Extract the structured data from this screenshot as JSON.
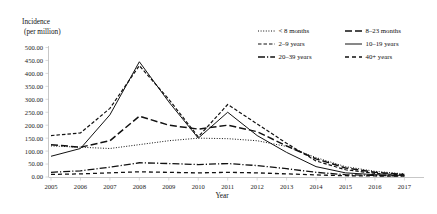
{
  "chart_data": {
    "type": "line",
    "title": "",
    "ylabel": "Incidence\n(per million)",
    "ylabel_line1": "Incidence",
    "ylabel_line2": "(per million)",
    "xlabel": "Year",
    "categories": [
      2005,
      2006,
      2007,
      2008,
      2009,
      2010,
      2011,
      2012,
      2013,
      2014,
      2015,
      2016,
      2017
    ],
    "x": [
      "2005",
      "2006",
      "2007",
      "2008",
      "2009",
      "2010",
      "2011",
      "2012",
      "2013",
      "2014",
      "2015",
      "2016",
      "2017"
    ],
    "ylim": [
      0,
      500
    ],
    "ytick_step": 50,
    "ytick_labels": [
      "0.00",
      "50.00",
      "100.00",
      "150.00",
      "200.00",
      "250.00",
      "300.00",
      "350.00",
      "400.00",
      "450.00",
      "500.00"
    ],
    "grid": false,
    "legend_position": "top-right",
    "legend_columns": 2,
    "series": [
      {
        "name": "< 8 months",
        "style": "dotted",
        "dash": "1,1.6",
        "width": 1.0,
        "values": [
          120,
          115,
          110,
          125,
          140,
          150,
          148,
          140,
          118,
          75,
          40,
          22,
          12
        ]
      },
      {
        "name": "8–23 months",
        "style": "long-dash",
        "dash": "7,3",
        "width": 1.5,
        "values": [
          125,
          115,
          140,
          235,
          200,
          185,
          200,
          175,
          120,
          70,
          35,
          18,
          10
        ]
      },
      {
        "name": "2–9 years",
        "style": "short-dash",
        "dash": "3.5,2",
        "width": 1.2,
        "values": [
          160,
          170,
          265,
          430,
          300,
          155,
          280,
          205,
          130,
          62,
          28,
          14,
          8
        ]
      },
      {
        "name": "10–19 years",
        "style": "solid",
        "dash": "none",
        "width": 1.0,
        "values": [
          80,
          110,
          240,
          445,
          290,
          150,
          250,
          160,
          95,
          40,
          16,
          9,
          6
        ]
      },
      {
        "name": "20–39 years",
        "style": "dash-dot",
        "dash": "7,2,1.2,2",
        "width": 1.3,
        "values": [
          18,
          24,
          38,
          55,
          52,
          48,
          52,
          44,
          32,
          18,
          9,
          6,
          4
        ]
      },
      {
        "name": "40+ years",
        "style": "dash",
        "dash": "4,3",
        "width": 1.3,
        "values": [
          10,
          12,
          16,
          20,
          18,
          16,
          18,
          16,
          12,
          8,
          5,
          4,
          3
        ]
      }
    ]
  },
  "legend": {
    "items": [
      {
        "label": "< 8 months"
      },
      {
        "label": "8–23 months"
      },
      {
        "label": "2–9 years"
      },
      {
        "label": "10–19 years"
      },
      {
        "label": "20–39 years"
      },
      {
        "label": "40+ years"
      }
    ]
  }
}
